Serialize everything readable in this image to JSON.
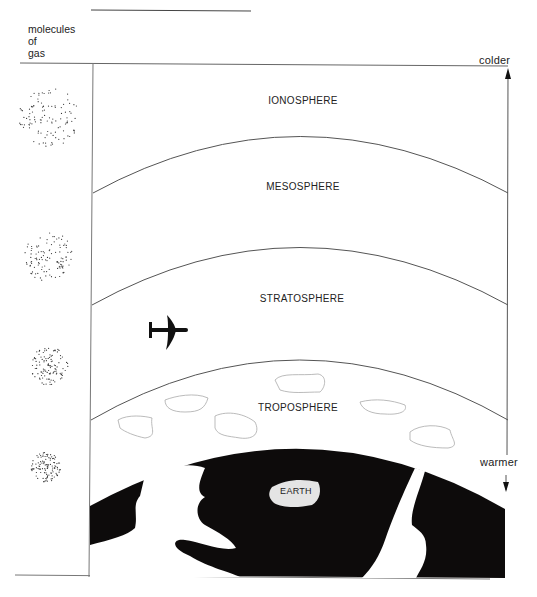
{
  "title_rule": "",
  "gas_label": {
    "lines": [
      "molecules",
      "of",
      "gas"
    ]
  },
  "temperature_axis": {
    "top_label": "colder",
    "bottom_label": "warmer"
  },
  "layers": [
    {
      "name": "IONOSPHERE"
    },
    {
      "name": "MESOSPHERE"
    },
    {
      "name": "STRATOSPHERE"
    },
    {
      "name": "TROPOSPHERE"
    },
    {
      "name": "EARTH"
    }
  ],
  "molecule_density": [
    "sparse",
    "less sparse",
    "denser",
    "densest"
  ],
  "icons": {
    "aircraft": "airplane-icon",
    "clouds": "cloud-icon"
  },
  "colors": {
    "line": "#555555",
    "earth": "#0d0b0b",
    "background": "#ffffff"
  }
}
